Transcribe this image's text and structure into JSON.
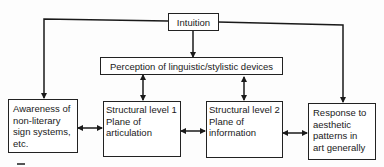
{
  "diagram": {
    "nodes": {
      "intuition": {
        "label": "Intuition"
      },
      "perception": {
        "label": "Perception of linguistic/stylistic devices"
      },
      "awareness": {
        "label": "Awareness of\nnon-literary\nsign systems,\netc."
      },
      "structural1": {
        "label": "Structural level 1\nPlane of\narticulation"
      },
      "structural2": {
        "label": "Structural level 2\nPlane of\ninformation"
      },
      "response": {
        "label": "Response to\naesthetic\npatterns in\nart generally"
      }
    },
    "edges": [
      {
        "from": "intuition",
        "to": "perception",
        "type": "one-way"
      },
      {
        "from": "intuition",
        "to": "awareness",
        "type": "one-way"
      },
      {
        "from": "intuition",
        "to": "response",
        "type": "one-way"
      },
      {
        "from": "perception",
        "to": "structural1",
        "type": "two-way"
      },
      {
        "from": "perception",
        "to": "structural2",
        "type": "two-way"
      },
      {
        "from": "awareness",
        "to": "structural1",
        "type": "two-way"
      },
      {
        "from": "structural1",
        "to": "structural2",
        "type": "two-way"
      },
      {
        "from": "structural2",
        "to": "response",
        "type": "two-way"
      }
    ]
  }
}
